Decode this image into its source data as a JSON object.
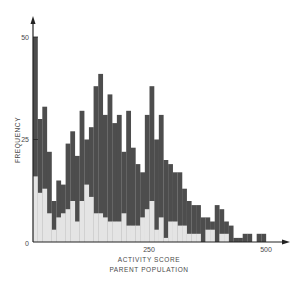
{
  "chart_data": {
    "type": "bar",
    "title": "",
    "xlabel": "ACTIVITY SCORE",
    "subtitle": "PARENT POPULATION",
    "ylabel": "FREQUENCY",
    "xlim": [
      0,
      520
    ],
    "ylim": [
      0,
      55
    ],
    "x_ticks": [
      0,
      250,
      500
    ],
    "y_ticks": [
      0,
      25,
      50
    ],
    "x_tick_labels": [
      "250",
      "500"
    ],
    "y_tick_labels": [
      "0",
      "25",
      "50"
    ],
    "bin_width": 10,
    "grid": false,
    "legend": null,
    "colors": {
      "total": "#4d4d4d",
      "subset": "#e4e4e4",
      "axis": "#222222"
    },
    "bins": [
      0,
      10,
      20,
      30,
      40,
      50,
      60,
      70,
      80,
      90,
      100,
      110,
      120,
      130,
      140,
      150,
      160,
      170,
      180,
      190,
      200,
      210,
      220,
      230,
      240,
      250,
      260,
      270,
      280,
      290,
      300,
      310,
      320,
      330,
      340,
      350,
      360,
      370,
      380,
      390,
      400,
      410,
      420,
      430,
      440,
      450,
      460,
      470,
      480,
      490
    ],
    "series": [
      {
        "name": "Parent population (total)",
        "values": [
          50,
          30,
          33,
          22,
          10,
          15,
          14,
          24,
          27,
          21,
          32,
          25,
          28,
          38,
          41,
          31,
          36,
          29,
          31,
          22,
          32,
          23,
          19,
          17,
          31,
          38,
          25,
          31,
          20,
          19,
          17,
          17,
          13,
          10,
          9,
          9,
          6,
          6,
          5,
          9,
          8,
          5,
          4,
          1,
          1,
          2,
          2,
          0,
          2,
          2
        ]
      },
      {
        "name": "Subset (light)",
        "values": [
          16,
          12,
          13,
          7,
          3,
          6,
          7,
          8,
          10,
          5,
          10,
          14,
          11,
          7,
          7,
          6,
          5,
          5,
          5,
          7,
          4,
          4,
          4,
          6,
          8,
          10,
          3,
          6,
          1,
          5,
          5,
          4,
          4,
          2,
          2,
          2,
          0,
          3,
          3,
          0,
          2,
          2,
          0,
          0,
          0,
          0,
          0,
          0,
          0,
          0
        ]
      }
    ]
  }
}
